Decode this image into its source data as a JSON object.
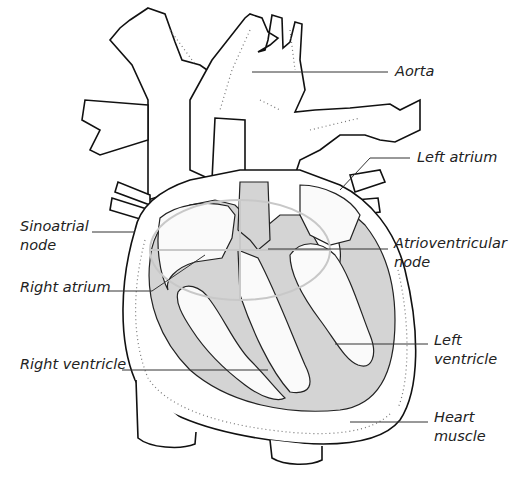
{
  "diagram": {
    "labels": [
      {
        "id": "aorta",
        "text": "Aorta",
        "x": 395,
        "y": 61
      },
      {
        "id": "left-atrium",
        "text": "Left atrium",
        "x": 417,
        "y": 148
      },
      {
        "id": "sinoatrial-node",
        "text": "Sinoatrial\nnode",
        "line1": "Sinoatrial",
        "line2": "node",
        "x": 20,
        "y": 217
      },
      {
        "id": "atrioventricular-node",
        "text": "Atrioventricular\nnode",
        "line1": "Atrioventricular",
        "line2": "node",
        "x": 394,
        "y": 234
      },
      {
        "id": "right-atrium",
        "text": "Right atrium",
        "x": 20,
        "y": 278
      },
      {
        "id": "left-ventricle",
        "text": "Left\nventricle",
        "line1": "Left",
        "line2": "ventricle",
        "x": 434,
        "y": 331
      },
      {
        "id": "right-ventricle",
        "text": "Right ventricle",
        "x": 20,
        "y": 355
      },
      {
        "id": "heart-muscle",
        "text": "Heart\nmuscle",
        "line1": "Heart",
        "line2": "muscle",
        "x": 434,
        "y": 408
      }
    ],
    "colors": {
      "outline": "#111111",
      "muscle_shade": "#d4d4d4",
      "background": "#ffffff",
      "text": "#222222"
    }
  }
}
